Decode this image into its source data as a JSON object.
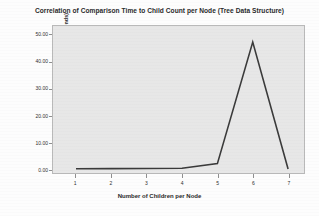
{
  "chart_data": {
    "type": "line",
    "title": "Correlation of Comparison Time to Child Count per Node (Tree Data Structure)",
    "xlabel": "Number of Children per Node",
    "ylabel": "Mean Comparison Time (Milliseconds)",
    "x": [
      1,
      2,
      3,
      4,
      5,
      6,
      7
    ],
    "values": [
      0.1,
      0.15,
      0.2,
      0.3,
      2.0,
      47.5,
      0.0
    ],
    "categories": [
      "1",
      "2",
      "3",
      "4",
      "5",
      "6",
      "7"
    ],
    "xtick_labels": [
      "1",
      "2",
      "3",
      "4",
      "5",
      "6",
      "7"
    ],
    "ytick_labels": [
      "0.00",
      "10.00",
      "20.00",
      "30.00",
      "40.00",
      "50.00"
    ],
    "ytick_values": [
      0,
      10,
      20,
      30,
      40,
      50
    ],
    "xlim": [
      0.35,
      7.45
    ],
    "ylim": [
      -1.5,
      53.5
    ],
    "grid": false,
    "legend": false,
    "series": [
      {
        "name": "Mean Comparison Time",
        "values": [
          0.1,
          0.15,
          0.2,
          0.3,
          2.0,
          47.5,
          0.0
        ]
      }
    ],
    "colors": {
      "line": "#3a3a3a",
      "plot_background": "#e7e7e7",
      "figure_background": "#fdfdfd",
      "frame": "#b9b9b9",
      "text": "#2a2a2a"
    }
  }
}
